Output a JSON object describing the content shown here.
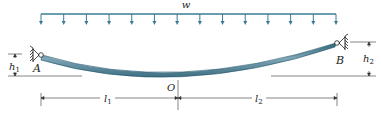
{
  "diagram": {
    "type": "beam-with-distributed-load",
    "load": {
      "label": "w",
      "arrow_count": 14,
      "color": "#3c7a96"
    },
    "supports": [
      {
        "label": "A",
        "type": "pin",
        "height_label": "h",
        "height_sub": "1"
      },
      {
        "label": "B",
        "type": "pin",
        "height_label": "h",
        "height_sub": "2"
      }
    ],
    "lowest_point": {
      "label": "O"
    },
    "spans": [
      {
        "label": "l",
        "sub": "1"
      },
      {
        "label": "l",
        "sub": "2"
      }
    ],
    "beam_color": "#4f7f92"
  }
}
